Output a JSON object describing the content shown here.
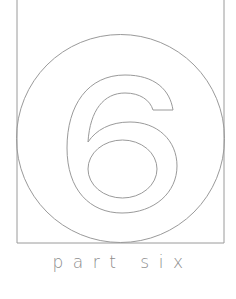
{
  "page": {
    "part_number": "6",
    "label": "part six"
  },
  "colors": {
    "background": "#ffffff",
    "line": "#9a9a9a",
    "text": "#8c8c8c"
  }
}
